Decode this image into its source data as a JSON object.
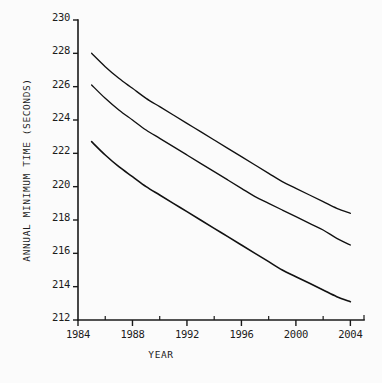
{
  "chart_data": {
    "type": "line",
    "title": "",
    "xlabel": "YEAR",
    "ylabel": "ANNUAL MINIMUM TIME (SECONDS)",
    "xlim": [
      1984,
      2005
    ],
    "ylim": [
      212,
      230
    ],
    "grid": false,
    "legend": "none",
    "x_ticks": [
      1984,
      1988,
      1992,
      1996,
      2000,
      2004
    ],
    "x_tick_labels": [
      "1984",
      "1988",
      "1992",
      "1996",
      "2000",
      "2004"
    ],
    "x_minor_ticks": [
      1986,
      1990,
      1994,
      1998,
      2002
    ],
    "y_ticks": [
      212,
      214,
      216,
      218,
      220,
      222,
      224,
      226,
      228,
      230
    ],
    "y_tick_labels": [
      "212",
      "214",
      "216",
      "218",
      "220",
      "222",
      "224",
      "226",
      "228",
      "230"
    ],
    "x": [
      1985,
      1986,
      1987,
      1988,
      1989,
      1990,
      1991,
      1992,
      1993,
      1994,
      1995,
      1996,
      1997,
      1998,
      1999,
      2000,
      2001,
      2002,
      2003,
      2004
    ],
    "series": [
      {
        "name": "upper-curve",
        "values": [
          228.0,
          227.2,
          226.5,
          225.9,
          225.3,
          224.8,
          224.3,
          223.8,
          223.3,
          222.8,
          222.3,
          221.8,
          221.3,
          220.8,
          220.3,
          219.9,
          219.5,
          219.1,
          218.7,
          218.4
        ]
      },
      {
        "name": "middle-curve",
        "values": [
          226.1,
          225.3,
          224.6,
          224.0,
          223.4,
          222.9,
          222.4,
          221.9,
          221.4,
          220.9,
          220.4,
          219.9,
          219.4,
          219.0,
          218.6,
          218.2,
          217.8,
          217.4,
          216.9,
          216.5
        ]
      },
      {
        "name": "lower-curve",
        "values": [
          222.7,
          221.9,
          221.2,
          220.6,
          220.0,
          219.5,
          219.0,
          218.5,
          218.0,
          217.5,
          217.0,
          216.5,
          216.0,
          215.5,
          215.0,
          214.6,
          214.2,
          213.8,
          213.4,
          213.1
        ]
      }
    ]
  },
  "colors": {
    "line": "#111111",
    "axis": "#1a1a1a",
    "background": "#fbfbfb",
    "text": "#1c1c1c"
  }
}
